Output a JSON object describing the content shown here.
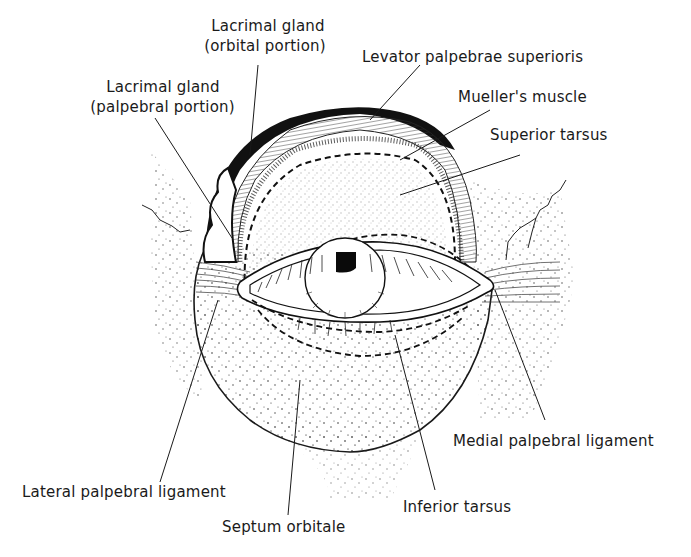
{
  "diagram": {
    "labels": {
      "lacrimal_orbital_l1": "Lacrimal gland",
      "lacrimal_orbital_l2": "(orbital portion)",
      "lacrimal_palpebral_l1": "Lacrimal gland",
      "lacrimal_palpebral_l2": "(palpebral portion)",
      "levator": "Levator palpebrae superioris",
      "mueller": "Mueller's muscle",
      "superior_tarsus": "Superior tarsus",
      "medial_ligament": "Medial palpebral ligament",
      "lateral_ligament": "Lateral palpebral ligament",
      "inferior_tarsus": "Inferior tarsus",
      "septum": "Septum orbitale"
    },
    "colors": {
      "ink": "#1a1a1a",
      "background": "#ffffff"
    }
  }
}
